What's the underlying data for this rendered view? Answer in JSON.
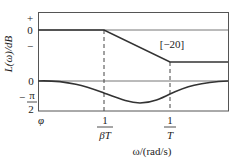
{
  "diagram": {
    "type": "bode-plot-lag-compensator",
    "y_label_magnitude": "L(ω)/dB",
    "y_label_phase": "φ",
    "x_label": "ω/(rad/s)",
    "magnitude_ticks": [
      "+",
      "0",
      "−"
    ],
    "phase_ticks": {
      "zero": "0",
      "neg_sign": "−",
      "numerator": "π",
      "denominator": "2"
    },
    "slope_annotation": "[−20]",
    "x_ticks": [
      {
        "numerator": "1",
        "denominator": "βT"
      },
      {
        "numerator": "1",
        "denominator": "T"
      }
    ],
    "colors": {
      "line": "#333333",
      "frame": "#555555",
      "text": "#222222"
    }
  }
}
